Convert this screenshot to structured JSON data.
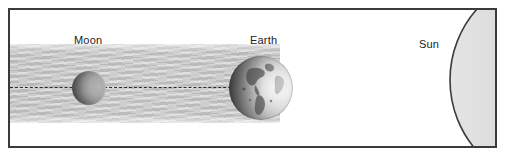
{
  "diagram": {
    "type": "lunar-eclipse-alignment",
    "frame": {
      "border_color": "#3a3a3a",
      "background_color": "#ffffff"
    },
    "bodies": [
      {
        "id": "sun",
        "label": "Sun",
        "shape": "partial-circle-arc",
        "position": "right",
        "center_x": 577,
        "center_y": 86,
        "radius": 107,
        "fill_color": "#d2d2d2",
        "outline_color": "#3c3c3c",
        "lit_side": "self-luminous"
      },
      {
        "id": "earth",
        "label": "Earth",
        "shape": "sphere",
        "position": "center",
        "center_x": 259,
        "center_y": 86,
        "radius": 32,
        "surface": "continents-visible",
        "lit_side": "right",
        "shadow_side": "left"
      },
      {
        "id": "moon",
        "label": "Moon",
        "shape": "sphere",
        "position": "left",
        "center_x": 87,
        "center_y": 86,
        "radius": 17,
        "fill_color": "#8e8e8e",
        "lit_side": "right",
        "shadow_side": "left"
      }
    ],
    "shadow_band": {
      "name": "umbra",
      "origin": "earth",
      "direction": "leftward",
      "top_y": 44,
      "bottom_y": 122,
      "color": "#c5c5c5",
      "texture": "faint-diagonal-streaks"
    },
    "axis_line": {
      "name": "sight-line",
      "style": "dashed",
      "color": "#2b2b2b",
      "y": 86,
      "from_x": 8,
      "to_x": 245
    }
  },
  "labels": {
    "moon": "Moon",
    "earth": "Earth",
    "sun": "Sun"
  }
}
